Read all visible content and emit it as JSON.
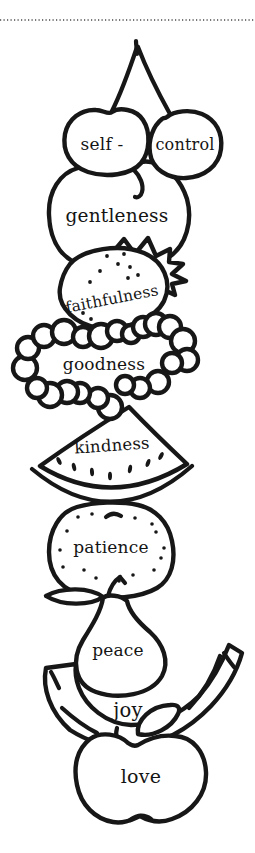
{
  "page": {
    "background_color": "#ffffff",
    "ink_color": "#171717",
    "dotted_edge_color": "#4a4a4a"
  },
  "fruits": [
    {
      "shape": "cherry-left",
      "label": "self -"
    },
    {
      "shape": "cherry-right",
      "label": "control"
    },
    {
      "shape": "apple",
      "label": "gentleness"
    },
    {
      "shape": "strawberry",
      "label": "faithfulness"
    },
    {
      "shape": "grapes",
      "label": "goodness"
    },
    {
      "shape": "watermelon-slice",
      "label": "kindness"
    },
    {
      "shape": "orange",
      "label": "patience"
    },
    {
      "shape": "pear",
      "label": "peace"
    },
    {
      "shape": "banana",
      "label": "joy"
    },
    {
      "shape": "apple",
      "label": "love"
    }
  ]
}
